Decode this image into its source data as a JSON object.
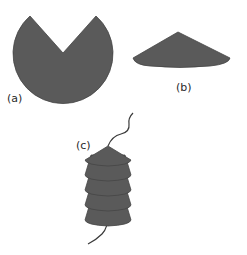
{
  "figure": {
    "panels": [
      {
        "id": "a",
        "label": "(a)",
        "description": "circle with wedge cut out (cone before folding)"
      },
      {
        "id": "b",
        "label": "(b)",
        "description": "flat cone formed from wedge-cut disc"
      },
      {
        "id": "c",
        "label": "(c)",
        "description": "stack of cones threaded on a strand",
        "cone_count": 5
      }
    ],
    "colors": {
      "shape_fill": "#5a5a5a",
      "outline": "#454545",
      "strand": "#3a3a3a",
      "label": "#2a2a2a"
    }
  }
}
